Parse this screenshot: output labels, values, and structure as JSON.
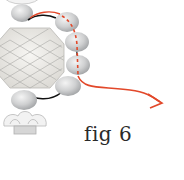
{
  "figure": {
    "caption": "fig 6",
    "colors": {
      "background": "#ffffff",
      "bead": "#c9cbcc",
      "bead_highlight": "#eeeeee",
      "crystal": "#ebeae6",
      "crystal_lines": "#a9a9a6",
      "thread_old": "#111111",
      "thread_new": "#e2482a",
      "caption": "#2a2a2a"
    },
    "elements": [
      {
        "type": "crystal",
        "label": "faceted round crystal"
      },
      {
        "type": "bead",
        "label": "top bead"
      },
      {
        "type": "bead",
        "label": "bottom bead"
      },
      {
        "type": "bead-cap",
        "label": "flower bead cap"
      },
      {
        "type": "beads",
        "label": "side bead column",
        "count": 4
      },
      {
        "type": "thread",
        "label": "existing thread path",
        "style": "solid black"
      },
      {
        "type": "thread",
        "label": "new thread path",
        "style": "red with arrow"
      }
    ]
  }
}
